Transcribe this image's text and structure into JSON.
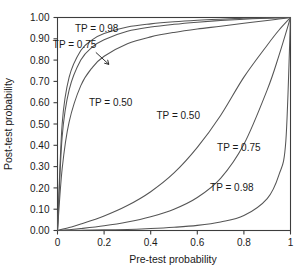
{
  "chart_data": {
    "type": "line",
    "title": "",
    "xlabel": "Pre-test probability",
    "ylabel": "Post-test probability",
    "xlim": [
      0,
      1
    ],
    "ylim": [
      0,
      1
    ],
    "grid": false,
    "legend_position": "inline-labels",
    "xticks": [
      "0",
      "0.2",
      "0.4",
      "0.6",
      "0.8",
      "1"
    ],
    "xtick_values": [
      0,
      0.2,
      0.4,
      0.6,
      0.8,
      1
    ],
    "yticks": [
      "0.00",
      "0.10",
      "0.20",
      "0.30",
      "0.40",
      "0.50",
      "0.60",
      "0.70",
      "0.80",
      "0.90",
      "1.00"
    ],
    "ytick_values": [
      0,
      0.1,
      0.2,
      0.3,
      0.4,
      0.5,
      0.6,
      0.7,
      0.8,
      0.9,
      1.0
    ],
    "series": [
      {
        "name": "TP = 0.98 (positive test)",
        "label": "TP = 0.98",
        "group": "upper",
        "tp": 0.98,
        "x": [
          0,
          0.02,
          0.05,
          0.1,
          0.15,
          0.2,
          0.3,
          0.4,
          0.5,
          0.6,
          0.7,
          0.8,
          0.9,
          0.95,
          1
        ],
        "y": [
          0,
          0.5,
          0.72,
          0.845,
          0.896,
          0.925,
          0.955,
          0.97,
          0.98,
          0.987,
          0.992,
          0.996,
          0.998,
          0.999,
          1
        ]
      },
      {
        "name": "TP = 0.75 (positive test)",
        "label": "TP = 0.75",
        "group": "upper",
        "tp": 0.75,
        "x": [
          0,
          0.02,
          0.05,
          0.1,
          0.15,
          0.2,
          0.3,
          0.4,
          0.5,
          0.6,
          0.7,
          0.8,
          0.9,
          0.95,
          1
        ],
        "y": [
          0,
          0.44,
          0.66,
          0.8,
          0.862,
          0.896,
          0.935,
          0.955,
          0.968,
          0.978,
          0.986,
          0.992,
          0.997,
          0.998,
          1
        ]
      },
      {
        "name": "TP = 0.50 (positive test)",
        "label": "TP = 0.50",
        "group": "upper",
        "tp": 0.5,
        "x": [
          0,
          0.02,
          0.05,
          0.1,
          0.15,
          0.2,
          0.3,
          0.4,
          0.5,
          0.6,
          0.7,
          0.8,
          0.9,
          0.95,
          1
        ],
        "y": [
          0,
          0.29,
          0.51,
          0.68,
          0.766,
          0.818,
          0.877,
          0.909,
          0.93,
          0.946,
          0.959,
          0.973,
          0.986,
          0.993,
          1
        ]
      },
      {
        "name": "TP = 0.50 (negative test)",
        "label": "TP = 0.50",
        "group": "lower",
        "tp": 0.5,
        "x": [
          0,
          0.05,
          0.1,
          0.2,
          0.3,
          0.4,
          0.5,
          0.6,
          0.7,
          0.8,
          0.9,
          0.95,
          1
        ],
        "y": [
          0,
          0.014,
          0.03,
          0.068,
          0.117,
          0.182,
          0.27,
          0.39,
          0.54,
          0.72,
          0.87,
          0.94,
          1
        ]
      },
      {
        "name": "TP = 0.75 (negative test)",
        "label": "TP = 0.75",
        "group": "lower",
        "tp": 0.75,
        "x": [
          0,
          0.05,
          0.1,
          0.2,
          0.3,
          0.4,
          0.5,
          0.6,
          0.7,
          0.8,
          0.9,
          0.95,
          1
        ],
        "y": [
          0,
          0.004,
          0.009,
          0.022,
          0.04,
          0.065,
          0.1,
          0.155,
          0.245,
          0.405,
          0.66,
          0.82,
          1
        ]
      },
      {
        "name": "TP = 0.98 (negative test)",
        "label": "TP = 0.98",
        "group": "lower",
        "tp": 0.98,
        "x": [
          0,
          0.1,
          0.2,
          0.3,
          0.4,
          0.5,
          0.6,
          0.7,
          0.8,
          0.9,
          0.95,
          0.98,
          1
        ],
        "y": [
          0,
          0.001,
          0.003,
          0.005,
          0.009,
          0.015,
          0.024,
          0.04,
          0.07,
          0.15,
          0.26,
          0.42,
          1
        ]
      }
    ],
    "annotations": [
      {
        "id": "label-upper-098",
        "text": "TP = 0.98",
        "x": 0.075,
        "y": 0.93
      },
      {
        "id": "label-upper-075",
        "text": "TP = 0.75",
        "x": -0.02,
        "y": 0.855,
        "arrow": true
      },
      {
        "id": "label-upper-050",
        "text": "TP = 0.50",
        "x": 0.135,
        "y": 0.585
      },
      {
        "id": "label-lower-050",
        "text": "TP = 0.50",
        "x": 0.425,
        "y": 0.525
      },
      {
        "id": "label-lower-075",
        "text": "TP = 0.75",
        "x": 0.685,
        "y": 0.375
      },
      {
        "id": "label-lower-098",
        "text": "TP = 0.98",
        "x": 0.655,
        "y": 0.185
      }
    ],
    "colors": {
      "curve": "#555555",
      "axis": "#3d3d3d",
      "text": "#1a1a1a",
      "background": "#ffffff"
    }
  },
  "caption_fragment": ""
}
